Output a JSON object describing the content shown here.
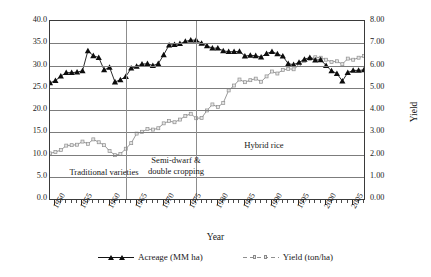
{
  "chart_data": {
    "type": "line",
    "title": "",
    "xlabel": "Year",
    "ylabel": "Acreage",
    "ylabel_right": "Yield",
    "grid": true,
    "legend_position": "bottom",
    "xlim": [
      1949,
      2007
    ],
    "ylim": [
      0,
      40
    ],
    "ylim_right": [
      0,
      8
    ],
    "x_tick_labels": [
      "1950",
      "1955",
      "1960",
      "1965",
      "1970",
      "1975",
      "1980",
      "1985",
      "1990",
      "1995",
      "2000",
      "2005"
    ],
    "y_tick_labels_left": [
      "0.0",
      "5.0",
      "10.0",
      "15.0",
      "20.0",
      "25.0",
      "30.0",
      "35.0",
      "40.0"
    ],
    "y_tick_labels_right": [
      "0.00",
      "1.00",
      "2.00",
      "3.00",
      "4.00",
      "5.00",
      "6.00",
      "7.00",
      "8.00"
    ],
    "x": [
      1949,
      1950,
      1951,
      1952,
      1953,
      1954,
      1955,
      1956,
      1957,
      1958,
      1959,
      1960,
      1961,
      1962,
      1963,
      1964,
      1965,
      1966,
      1967,
      1968,
      1969,
      1970,
      1971,
      1972,
      1973,
      1974,
      1975,
      1976,
      1977,
      1978,
      1979,
      1980,
      1981,
      1982,
      1983,
      1984,
      1985,
      1986,
      1987,
      1988,
      1989,
      1990,
      1991,
      1992,
      1993,
      1994,
      1995,
      1996,
      1997,
      1998,
      1999,
      2000,
      2001,
      2002,
      2003,
      2004,
      2005,
      2006,
      2007
    ],
    "series": [
      {
        "name": "Acreage (MM ha)",
        "unit": "MM ha",
        "axis": "left",
        "marker": "triangle",
        "color": "#0d0d0d",
        "values": [
          26.1,
          26.6,
          27.6,
          28.4,
          28.4,
          28.5,
          28.8,
          33.3,
          32.2,
          31.8,
          29.0,
          29.6,
          26.3,
          26.8,
          27.5,
          29.4,
          29.8,
          30.3,
          30.4,
          30.0,
          30.4,
          32.4,
          34.6,
          34.7,
          34.9,
          35.4,
          35.7,
          35.7,
          35.0,
          34.4,
          33.9,
          33.9,
          33.3,
          33.1,
          33.1,
          33.2,
          32.1,
          32.3,
          32.2,
          31.9,
          32.7,
          33.1,
          32.6,
          32.1,
          30.4,
          30.2,
          30.7,
          31.4,
          31.8,
          31.2,
          31.3,
          30.0,
          28.8,
          28.2,
          26.5,
          28.4,
          28.9,
          28.9,
          29.0
        ]
      },
      {
        "name": "Yield (ton/ha)",
        "unit": "ton/ha",
        "axis": "right",
        "marker": "square",
        "color": "#9a9a9a",
        "values": [
          2.05,
          2.11,
          2.2,
          2.4,
          2.42,
          2.44,
          2.58,
          2.48,
          2.68,
          2.55,
          2.42,
          2.16,
          1.97,
          2.02,
          2.26,
          2.51,
          2.94,
          3.02,
          3.14,
          3.12,
          3.18,
          3.4,
          3.5,
          3.45,
          3.57,
          3.73,
          3.83,
          3.63,
          3.64,
          3.98,
          4.25,
          4.13,
          4.32,
          4.88,
          5.1,
          5.37,
          5.25,
          5.34,
          5.41,
          5.27,
          5.51,
          5.73,
          5.64,
          5.8,
          5.85,
          5.83,
          6.02,
          6.21,
          6.3,
          6.37,
          6.35,
          6.26,
          6.16,
          6.19,
          6.06,
          6.31,
          6.26,
          6.35,
          6.43
        ]
      }
    ],
    "annotations": [
      {
        "text": "Traditional varieties",
        "x_range": [
          1949,
          1963
        ],
        "note": "era label"
      },
      {
        "text": "Semi-dwarf &\ndouble cropping",
        "x_range": [
          1963,
          1976
        ],
        "note": "era label"
      },
      {
        "text": "Hybrid rice",
        "x_range": [
          1976,
          2007
        ],
        "note": "era label"
      }
    ],
    "era_dividers": [
      1963,
      1976
    ]
  },
  "axes": {
    "left_title": "Acreage",
    "right_title": "Yield",
    "x_title": "Year"
  },
  "annotations": {
    "traditional": "Traditional varieties",
    "semidwarf_line1": "Semi-dwarf &",
    "semidwarf_line2": "double cropping",
    "hybrid": "Hybrid rice"
  },
  "legend": {
    "acreage_label": "Acreage (MM ha)",
    "yield_label": "Yield (ton/ha)"
  },
  "colors": {
    "acreage": "#0d0d0d",
    "yield": "#9a9a9a",
    "grid": "#7c7c7c",
    "frame": "#3a3a3a"
  }
}
